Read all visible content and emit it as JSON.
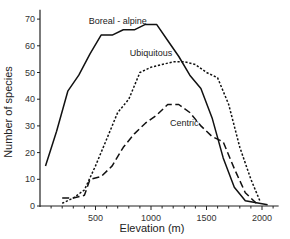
{
  "chart_data": {
    "type": "line",
    "title": "",
    "xlabel": "Elevation (m)",
    "ylabel": "Number of species",
    "xlim": [
      0,
      2150
    ],
    "ylim": [
      0,
      72
    ],
    "xticks": [
      500,
      1000,
      1500,
      2000
    ],
    "xtick_labels": [
      "500",
      "1000",
      "1500",
      "2000"
    ],
    "yticks": [
      0,
      10,
      20,
      30,
      40,
      50,
      60,
      70
    ],
    "ytick_labels": [
      "0",
      "10",
      "20",
      "30",
      "40",
      "50",
      "60",
      "70"
    ],
    "grid": false,
    "legend": "inline labels",
    "series": [
      {
        "name": "Boreal - alpine",
        "style": "solid",
        "label_pos": [
          700,
          68
        ],
        "x": [
          50,
          150,
          250,
          350,
          450,
          550,
          650,
          750,
          850,
          950,
          1050,
          1150,
          1250,
          1350,
          1450,
          1550,
          1650,
          1750,
          1850,
          2050
        ],
        "values": [
          15,
          28,
          43,
          49,
          57,
          64,
          64,
          66,
          66,
          68,
          68,
          62,
          56,
          49,
          44,
          33,
          18,
          7,
          2,
          0.5
        ]
      },
      {
        "name": "Ubiquitous",
        "style": "dotted",
        "label_pos": [
          1000,
          56
        ],
        "x": [
          200,
          300,
          400,
          500,
          600,
          700,
          800,
          900,
          1000,
          1100,
          1200,
          1300,
          1400,
          1500,
          1600,
          1700,
          1800,
          1900,
          1980
        ],
        "values": [
          1,
          3,
          6,
          15,
          25,
          35,
          40,
          50,
          52,
          53,
          54,
          54,
          53,
          50,
          48,
          38,
          22,
          10,
          2
        ]
      },
      {
        "name": "Centric",
        "style": "dashed",
        "label_pos": [
          1300,
          30
        ],
        "x": [
          200,
          300,
          400,
          450,
          550,
          650,
          750,
          850,
          950,
          1050,
          1150,
          1250,
          1350,
          1450,
          1550,
          1650,
          1750,
          1850,
          1950
        ],
        "values": [
          3,
          3,
          4,
          10,
          11,
          15,
          22,
          27,
          31,
          34,
          38,
          38,
          35,
          30,
          26,
          24,
          14,
          5,
          1
        ]
      }
    ]
  }
}
